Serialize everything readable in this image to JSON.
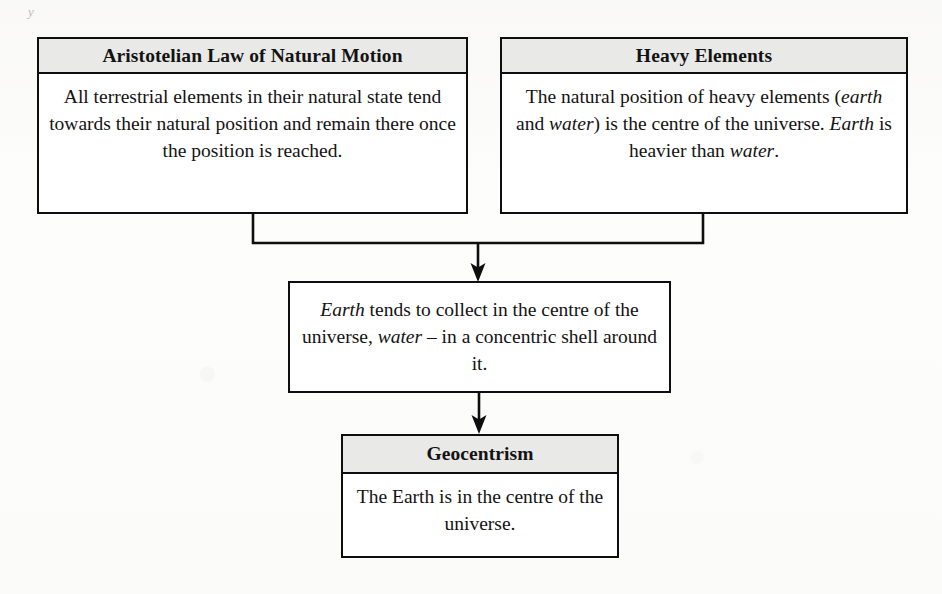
{
  "page": {
    "edge_mark": "y",
    "background_color": "#fdfdfc",
    "ink_color": "#0e0e0e",
    "header_fill_color": "#e9e9e7"
  },
  "diagram": {
    "type": "flowchart",
    "nodes": [
      {
        "id": "aristotelian-law",
        "title": "Aristotelian Law of Natural Motion",
        "body_html": "All terrestrial elements in their natural state tend towards their natural position and remain there once the position is reached.",
        "body_plain": "All terrestrial elements in their natural state tend towards their natural position and remain there once the position is reached.",
        "has_header": true
      },
      {
        "id": "heavy-elements",
        "title": "Heavy Elements",
        "body_html": "The natural position of heavy elements (<em>earth</em> and <em>water</em>) is the centre of the universe. <em>Earth</em> is heavier than <em>water</em>.",
        "body_plain": "The natural position of heavy elements (earth and water) is the centre of the universe. Earth is heavier than water.",
        "has_header": true
      },
      {
        "id": "earth-collects",
        "title": "",
        "body_html": "<em>Earth</em> tends to collect in the centre of the universe, <em>water</em> &#8211; in a concentric shell around it.",
        "body_plain": "Earth tends to collect in the centre of the universe, water – in a concentric shell around it.",
        "has_header": false
      },
      {
        "id": "geocentrism",
        "title": "Geocentrism",
        "body_html": "The Earth is in the centre of the universe.",
        "body_plain": "The Earth is in the centre of the universe.",
        "has_header": true
      }
    ],
    "edges": [
      {
        "id": "edge-aristotelian-to-earth-collects",
        "from": "aristotelian-law",
        "to": "earth-collects",
        "style": "elbow-merge",
        "arrowhead": true
      },
      {
        "id": "edge-heavy-to-earth-collects",
        "from": "heavy-elements",
        "to": "earth-collects",
        "style": "elbow-merge",
        "arrowhead": true
      },
      {
        "id": "edge-earth-collects-to-geocentrism",
        "from": "earth-collects",
        "to": "geocentrism",
        "style": "straight",
        "arrowhead": true
      }
    ]
  }
}
